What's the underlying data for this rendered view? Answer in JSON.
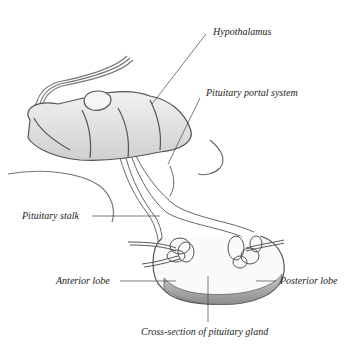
{
  "figure": {
    "labels": {
      "hypothalamus": "Hypothalamus",
      "portal_system": "Pituitary portal system",
      "stalk": "Pituitary stalk",
      "anterior": "Anterior lobe",
      "posterior": "Posterior lobe",
      "cross_section": "Cross-section of pituitary gland"
    },
    "colors": {
      "background": "#ffffff",
      "line": "#555555",
      "tissue_fill": "#e6e6e6",
      "tissue_shade": "#b5b5b5",
      "gland_base": "#9a9a9a",
      "text": "#222222"
    }
  }
}
